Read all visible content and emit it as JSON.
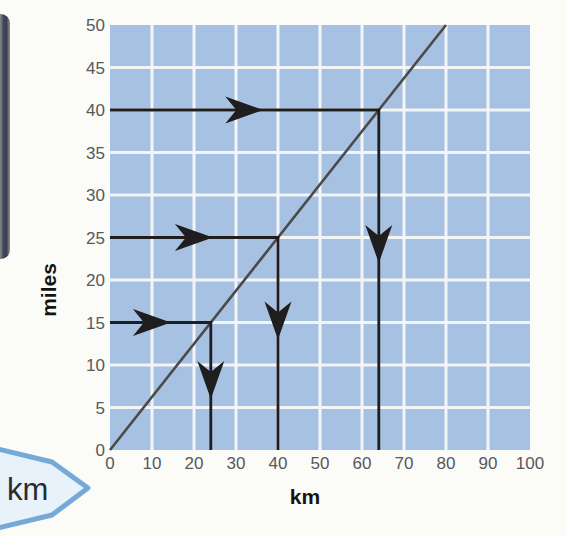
{
  "chart_data": {
    "type": "line",
    "title": "",
    "xlabel": "km",
    "ylabel": "miles",
    "xlim": [
      0,
      100
    ],
    "ylim": [
      0,
      50
    ],
    "x_ticks": [
      0,
      10,
      20,
      30,
      40,
      50,
      60,
      70,
      80,
      90,
      100
    ],
    "y_ticks": [
      0,
      5,
      10,
      15,
      20,
      25,
      30,
      35,
      40,
      45,
      50
    ],
    "grid": true,
    "series": [
      {
        "name": "km-to-miles conversion line",
        "points": [
          [
            0,
            0
          ],
          [
            80,
            50
          ]
        ],
        "slope_miles_per_km": 0.625
      }
    ],
    "guides": [
      {
        "miles": 40,
        "km": 64,
        "h_head_km": 36.5,
        "v_head_miles": 22
      },
      {
        "miles": 25,
        "km": 40,
        "h_head_km": 24.5,
        "v_head_miles": 13
      },
      {
        "miles": 15,
        "km": 24,
        "h_head_km": 14.5,
        "v_head_miles": 6
      }
    ]
  },
  "banner": {
    "label": "km"
  },
  "colors": {
    "page_background": "#fbfbf8",
    "plot_fill": "#a7c1e3",
    "grid_line": "#f3f5f6",
    "conversion_line": "#4a4a48",
    "arrow": "#1f1d1e",
    "tick_label": "#57585a",
    "axis_label": "#141414",
    "banner_fill": "#e7f2fb",
    "banner_border": "#74a9d8",
    "banner_text": "#2b2b2b"
  }
}
